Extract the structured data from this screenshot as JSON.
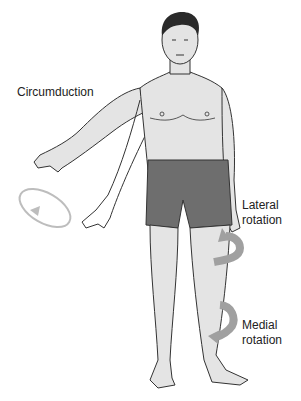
{
  "figure": {
    "labels": {
      "circumduction": "Circumduction",
      "lateral_line1": "Lateral",
      "lateral_line2": "rotation",
      "medial_line1": "Medial",
      "medial_line2": "rotation"
    },
    "colors": {
      "skin": "#e4e4e4",
      "outline": "#333333",
      "shorts": "#6e6e6e",
      "hair": "#2a2a2a",
      "arrow": "#a0a0a0",
      "circle_arrow": "#bdbdbd"
    }
  }
}
